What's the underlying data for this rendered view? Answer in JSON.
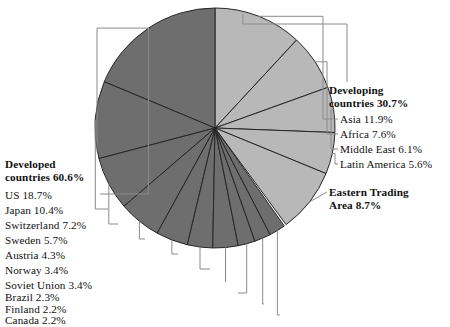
{
  "chart_data": {
    "type": "pie",
    "title": "",
    "unit": "%",
    "total": 100.0,
    "groups": [
      {
        "name": "Developing countries",
        "value": 30.7,
        "color": "#b8b8b8",
        "label_line1": "Developing",
        "label_line2": "countries 30.7%",
        "members": [
          {
            "label": "Asia 11.9%",
            "name": "Asia",
            "value": 11.9
          },
          {
            "label": "Africa 7.6%",
            "name": "Africa",
            "value": 7.6
          },
          {
            "label": "Middle East 6.1%",
            "name": "Middle East",
            "value": 6.1
          },
          {
            "label": "Latin America 5.6%",
            "name": "Latin America",
            "value": 5.6
          }
        ]
      },
      {
        "name": "Eastern Trading Area",
        "value": 8.7,
        "color": "#b8b8b8",
        "label_line1": "Eastern Trading",
        "label_line2": "Area 8.7%",
        "members": []
      },
      {
        "name": "Developed countries",
        "value": 60.6,
        "color": "#6e6e6e",
        "label_line1": "Developed",
        "label_line2": "countries 60.6%",
        "members": [
          {
            "label": "US 18.7%",
            "name": "US",
            "value": 18.7
          },
          {
            "label": "Japan 10.4%",
            "name": "Japan",
            "value": 10.4
          },
          {
            "label": "Switzerland 7.2%",
            "name": "Switzerland",
            "value": 7.2
          },
          {
            "label": "Sweden 5.7%",
            "name": "Sweden",
            "value": 5.7
          },
          {
            "label": "Austria 4.3%",
            "name": "Austria",
            "value": 4.3
          },
          {
            "label": "Norway 3.4%",
            "name": "Norway",
            "value": 3.4
          },
          {
            "label": "Soviet Union 3.4%",
            "name": "Soviet Union",
            "value": 3.4
          },
          {
            "label": "Brazil 2.3%",
            "name": "Brazil",
            "value": 2.3
          },
          {
            "label": "Finland 2.2%",
            "name": "Finland",
            "value": 2.2
          },
          {
            "label": "Canada 2.2%",
            "name": "Canada",
            "value": 2.2
          }
        ]
      }
    ],
    "colors": {
      "light_slice": "#b8b8b8",
      "dark_slice": "#6e6e6e",
      "slice_outline": "#262626",
      "leader_line": "#8a8a8a",
      "text": "#111111",
      "background": "#ffffff"
    },
    "geometry": {
      "center_x": 215,
      "center_y": 128,
      "radius": 120,
      "start_angle_deg": 0,
      "direction": "developing-clockwise-developed-counterclockwise"
    }
  }
}
